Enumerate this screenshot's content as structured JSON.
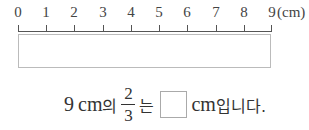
{
  "ruler": {
    "ticks": [
      "0",
      "1",
      "2",
      "3",
      "4",
      "5",
      "6",
      "7",
      "8",
      "9"
    ],
    "unit": "(cm)"
  },
  "question": {
    "whole_value": "9",
    "whole_unit": "cm",
    "particle_of": "의",
    "fraction_numerator": "2",
    "fraction_denominator": "3",
    "particle_topic": "는",
    "answer_value": "",
    "answer_unit": "cm",
    "ending": "입니다."
  }
}
